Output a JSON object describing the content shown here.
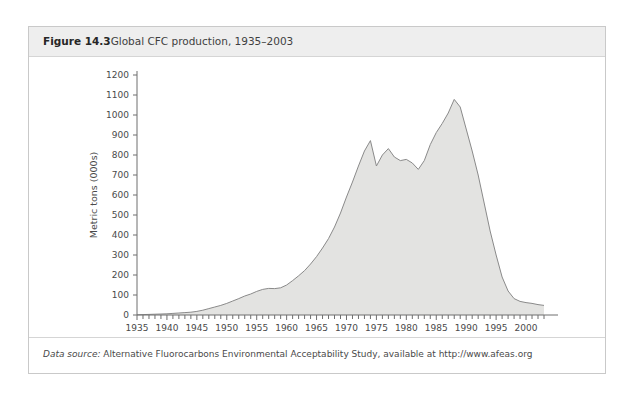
{
  "figure": {
    "number": "Figure 14.3",
    "title": "Global CFC production, 1935–2003",
    "source_label": "Data source:",
    "source_text": " Alternative Fluorocarbons Environmental Acceptability Study, available at http://www.afeas.org"
  },
  "colors": {
    "area_fill": "#e3e3e1",
    "area_line": "#8a8a8a",
    "axis": "#6e6e6e",
    "header_bg": "#eeeeee",
    "card_border": "#c9c9c9",
    "text": "#4a4a4a"
  },
  "chart_data": {
    "type": "area",
    "title": "Global CFC production, 1935–2003",
    "xlabel": "Year",
    "ylabel": "Metric tons (000s)",
    "xlim": [
      1935,
      2003
    ],
    "ylim": [
      0,
      1200
    ],
    "ytick_step": 100,
    "xtick_major_step": 5,
    "xtick_minor_step": 1,
    "grid": false,
    "legend": false,
    "yticks": [
      0,
      100,
      200,
      300,
      400,
      500,
      600,
      700,
      800,
      900,
      1000,
      1100,
      1200
    ],
    "xticks": [
      1935,
      1940,
      1945,
      1950,
      1955,
      1960,
      1965,
      1970,
      1975,
      1980,
      1985,
      1990,
      1995,
      2000
    ],
    "series_name": "Global CFC production",
    "x": [
      1935,
      1936,
      1937,
      1938,
      1939,
      1940,
      1941,
      1942,
      1943,
      1944,
      1945,
      1946,
      1947,
      1948,
      1949,
      1950,
      1951,
      1952,
      1953,
      1954,
      1955,
      1956,
      1957,
      1958,
      1959,
      1960,
      1961,
      1962,
      1963,
      1964,
      1965,
      1966,
      1967,
      1968,
      1969,
      1970,
      1971,
      1972,
      1973,
      1974,
      1975,
      1976,
      1977,
      1978,
      1979,
      1980,
      1981,
      1982,
      1983,
      1984,
      1985,
      1986,
      1987,
      1988,
      1989,
      1990,
      1991,
      1992,
      1993,
      1994,
      1995,
      1996,
      1997,
      1998,
      1999,
      2000,
      2001,
      2002,
      2003
    ],
    "values": [
      1,
      2,
      3,
      4,
      5,
      6,
      8,
      10,
      12,
      14,
      18,
      24,
      32,
      40,
      48,
      58,
      70,
      82,
      95,
      105,
      118,
      128,
      133,
      132,
      136,
      150,
      172,
      196,
      222,
      255,
      292,
      335,
      382,
      440,
      510,
      590,
      665,
      745,
      820,
      872,
      745,
      800,
      832,
      790,
      772,
      778,
      760,
      728,
      772,
      852,
      912,
      958,
      1010,
      1078,
      1040,
      930,
      820,
      700,
      560,
      420,
      300,
      190,
      120,
      82,
      68,
      62,
      58,
      52,
      48
    ]
  }
}
